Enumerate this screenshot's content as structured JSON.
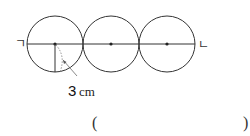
{
  "diagram": {
    "circle_count": 3,
    "left_point_label": "ㄱ",
    "right_point_label": "ㄴ",
    "radius_label": {
      "value": "3",
      "unit": "cm"
    },
    "answer_blank": {
      "open": "(",
      "close": ")"
    }
  }
}
